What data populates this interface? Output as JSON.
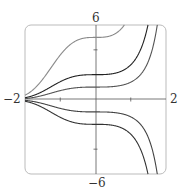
{
  "chart_data": {
    "type": "line",
    "title": "",
    "xlabel": "",
    "ylabel": "",
    "xlim": [
      -2,
      2
    ],
    "ylim": [
      -6,
      6
    ],
    "grid": false,
    "legend": null,
    "tick_labels": {
      "x_min": "−2",
      "x_max": "2",
      "y_max": "6",
      "y_min": "−6"
    },
    "x_ticks": [
      -1,
      1
    ],
    "y_ticks": [
      -4,
      4
    ],
    "family": "y = C·e^(x³/3)",
    "series": [
      {
        "name": "C=5",
        "C": 5,
        "color": "#8a8a8a"
      },
      {
        "name": "C=2",
        "C": 2,
        "color": "#222222"
      },
      {
        "name": "C=1",
        "C": 1,
        "color": "#555555"
      },
      {
        "name": "C=-1",
        "C": -1,
        "color": "#444444"
      },
      {
        "name": "C=-2",
        "C": -2,
        "color": "#333333"
      }
    ]
  }
}
